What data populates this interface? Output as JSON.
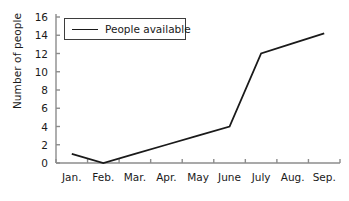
{
  "chart_data": {
    "type": "line",
    "title": "",
    "xlabel": "",
    "ylabel": "Number of people",
    "categories": [
      "Jan.",
      "Feb.",
      "Mar.",
      "Apr.",
      "May",
      "June",
      "July",
      "Aug.",
      "Sep."
    ],
    "series": [
      {
        "name": "People available",
        "values": [
          1,
          0,
          1,
          2,
          3,
          4,
          12,
          13.1,
          14.2
        ],
        "color": "#1a1a1a"
      }
    ],
    "ylim": [
      0,
      16
    ],
    "yticks": [
      0,
      2,
      4,
      6,
      8,
      10,
      12,
      14,
      16
    ],
    "ytick_labels": [
      "0",
      "2",
      "4",
      "6",
      "8",
      "10",
      "12",
      "14",
      "16"
    ],
    "grid": false,
    "legend": {
      "position": "top-left-inside",
      "entries": [
        {
          "label": "People available",
          "marker": "line-swatch"
        }
      ]
    },
    "axis_color": "#8c8c8c",
    "text_color": "#1a1a1a",
    "background": "#ffffff"
  }
}
